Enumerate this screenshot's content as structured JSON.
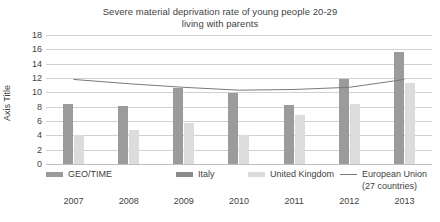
{
  "chart_data": {
    "type": "bar",
    "title": "Severe material deprivation rate of young people 20-29 living with parents",
    "title_lines": [
      "Severe material deprivation rate of young people 20-29",
      "living with parents"
    ],
    "xlabel": "",
    "ylabel": "Axis Title",
    "ylim": [
      0,
      18
    ],
    "ytick_step": 2,
    "yticks": [
      0,
      2,
      4,
      6,
      8,
      10,
      12,
      14,
      16,
      18
    ],
    "grid": true,
    "legend_position": "bottom",
    "categories": [
      "2007",
      "2008",
      "2009",
      "2010",
      "2011",
      "2012",
      "2013"
    ],
    "series": [
      {
        "name": "GEO/TIME",
        "kind": "bar",
        "color": "#9b9b9b",
        "values": [
          null,
          null,
          null,
          null,
          null,
          null,
          null
        ]
      },
      {
        "name": "Italy",
        "kind": "bar",
        "color": "#9b9b9b",
        "values": [
          8.4,
          8.1,
          10.6,
          9.9,
          8.3,
          11.9,
          15.6
        ]
      },
      {
        "name": "United Kingdom",
        "kind": "bar",
        "color": "#dcdcdc",
        "values": [
          4.1,
          4.7,
          5.7,
          4.0,
          6.9,
          8.4,
          11.3
        ]
      },
      {
        "name": "European Union (27 countries)",
        "kind": "line",
        "color": "#7a7a7a",
        "values": [
          11.8,
          11.2,
          10.7,
          10.3,
          10.4,
          10.7,
          11.8
        ]
      }
    ]
  },
  "legend": {
    "items": [
      {
        "label": "GEO/TIME",
        "swatch": "geotime"
      },
      {
        "label": "Italy",
        "swatch": "italy"
      },
      {
        "label": "United Kingdom",
        "swatch": "uk"
      },
      {
        "label": "European Union",
        "sub": "(27 countries)",
        "swatch": "line-sw"
      }
    ]
  },
  "colors": {
    "italy_bar": "#9b9b9b",
    "uk_bar": "#dcdcdc",
    "eu_line": "#7a7a7a",
    "gridline": "#d0d0d0",
    "text": "#3f3f3f",
    "background": "#ffffff"
  }
}
